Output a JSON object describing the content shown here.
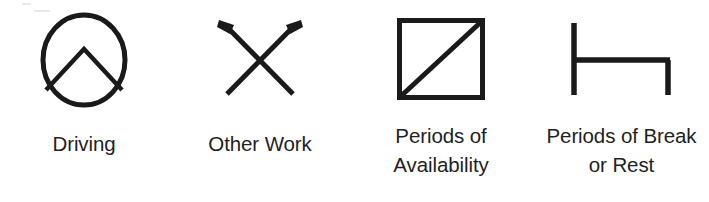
{
  "legend": {
    "title": "Tachograph Mode Symbols",
    "ink_color": "#231f20",
    "background_color": "#ffffff",
    "items": [
      {
        "icon": "driving-circle-icon",
        "label_lines": [
          "Driving"
        ],
        "label_text": "Driving"
      },
      {
        "icon": "crossed-hammers-icon",
        "label_lines": [
          "Other Work"
        ],
        "label_text": "Other Work"
      },
      {
        "icon": "square-diagonal-icon",
        "label_lines": [
          "Periods of",
          "Availability"
        ],
        "label_text": "Periods of Availability"
      },
      {
        "icon": "bed-break-rest-icon",
        "label_lines": [
          "Periods of Break",
          "or Rest"
        ],
        "label_text": "Periods of Break or Rest"
      }
    ]
  }
}
